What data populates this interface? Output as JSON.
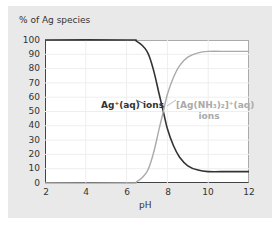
{
  "chart_data": {
    "type": "line",
    "title": "",
    "xlabel": "pH",
    "ylabel": "% of Ag species",
    "xlim": [
      2,
      12
    ],
    "ylim": [
      0,
      100
    ],
    "xticks": [
      2,
      4,
      6,
      8,
      10,
      12
    ],
    "yticks": [
      0,
      10,
      20,
      30,
      40,
      50,
      60,
      70,
      80,
      90,
      100
    ],
    "grid": true,
    "series": [
      {
        "name": "Ag+(aq) ions",
        "color": "#333333",
        "x": [
          2,
          6,
          6.5,
          7,
          7.3,
          7.6,
          7.8,
          8,
          8.3,
          8.6,
          9,
          9.5,
          10,
          11,
          12
        ],
        "y": [
          100,
          100,
          99,
          92,
          80,
          62,
          50,
          38,
          26,
          18,
          12,
          9,
          8,
          8,
          8
        ]
      },
      {
        "name": "[Ag(NH3)2]+(aq) ions",
        "color": "#aaaaaa",
        "x": [
          2,
          6,
          6.5,
          7,
          7.3,
          7.6,
          7.8,
          8,
          8.3,
          8.6,
          9,
          9.5,
          10,
          11,
          12
        ],
        "y": [
          0,
          0,
          1,
          8,
          20,
          38,
          50,
          62,
          74,
          82,
          88,
          91,
          92,
          92,
          92
        ]
      }
    ],
    "annotations": [
      "Ag+(aq) ions",
      "[Ag(NH3)2]+(aq) ions"
    ]
  },
  "labels": {
    "y_title": "% of Ag species",
    "x_title": "pH",
    "ag_label": "Ag⁺(aq) ions",
    "complex_label_1": "[Ag(NH₃)₂]⁺(aq)",
    "complex_label_2": "ions"
  },
  "ticks": {
    "y": [
      "100",
      "90",
      "80",
      "70",
      "60",
      "50",
      "40",
      "30",
      "20",
      "10",
      "0"
    ],
    "x": [
      "2",
      "4",
      "6",
      "8",
      "10",
      "12"
    ]
  }
}
